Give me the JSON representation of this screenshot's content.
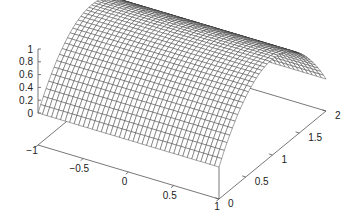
{
  "chart_data": {
    "type": "surface3d",
    "title": "",
    "function": "z = 1 - (y - 1)^2",
    "x": {
      "label": "",
      "range": [
        -1,
        1
      ],
      "ticks": [
        -1,
        -0.5,
        0,
        0.5,
        1
      ],
      "tick_labels": [
        "−1",
        "−0.5",
        "0",
        "0.5",
        "1"
      ]
    },
    "y": {
      "label": "",
      "range": [
        0,
        2
      ],
      "ticks": [
        0,
        0.5,
        1,
        1.5,
        2
      ],
      "tick_labels": [
        "0",
        "0.5",
        "1",
        "1.5",
        "2"
      ]
    },
    "z": {
      "label": "",
      "range": [
        0,
        1
      ],
      "ticks": [
        0,
        0.2,
        0.4,
        0.6,
        0.8,
        1
      ],
      "tick_labels": [
        "0",
        "0.2",
        "0.4",
        "0.6",
        "0.8",
        "1"
      ]
    },
    "mesh": {
      "x_samples": 40,
      "y_samples": 40,
      "style": "hidden-line wireframe",
      "color": "#333333"
    },
    "grid": false,
    "legend": "none",
    "base_plane_z": -0.5
  }
}
